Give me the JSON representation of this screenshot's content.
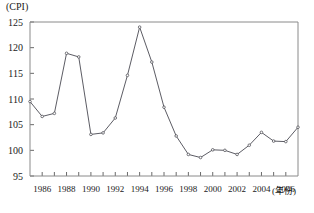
{
  "chart_data": {
    "type": "line",
    "title": "",
    "subtitle": "",
    "xlabel": "(年份)",
    "ylabel": "(CPI)",
    "x": [
      1985,
      1986,
      1987,
      1988,
      1989,
      1990,
      1991,
      1992,
      1993,
      1994,
      1995,
      1996,
      1997,
      1998,
      1999,
      2000,
      2001,
      2002,
      2003,
      2004,
      2005,
      2006,
      2007
    ],
    "values": [
      109.5,
      106.6,
      107.2,
      118.9,
      118.2,
      103.1,
      103.4,
      106.3,
      114.6,
      124.0,
      117.2,
      108.4,
      102.8,
      99.2,
      98.6,
      100.1,
      100.0,
      99.2,
      101.0,
      103.5,
      101.8,
      101.7,
      104.5
    ],
    "series": [
      {
        "name": "CPI",
        "values": [
          109.5,
          106.6,
          107.2,
          118.9,
          118.2,
          103.1,
          103.4,
          106.3,
          114.6,
          124.0,
          117.2,
          108.4,
          102.8,
          99.2,
          98.6,
          100.1,
          100.0,
          99.2,
          101.0,
          103.5,
          101.8,
          101.7,
          104.5
        ]
      }
    ],
    "ytick_labels": [
      "95",
      "100",
      "105",
      "110",
      "115",
      "120",
      "125"
    ],
    "ytick_values": [
      95,
      100,
      105,
      110,
      115,
      120,
      125
    ],
    "xtick_labels": [
      "1986",
      "1988",
      "1990",
      "1992",
      "1994",
      "1996",
      "1998",
      "2000",
      "2002",
      "2004",
      "2006"
    ],
    "xtick_values": [
      1986,
      1988,
      1990,
      1992,
      1994,
      1996,
      1998,
      2000,
      2002,
      2004,
      2006
    ],
    "xlim": [
      1985,
      2007
    ],
    "ylim": [
      95,
      125
    ],
    "grid": false,
    "legend": false,
    "legend_position": "none",
    "line_color": "#4a4a52",
    "marker_color": "#3f3f46",
    "axis_color": "#8a8a8a"
  }
}
